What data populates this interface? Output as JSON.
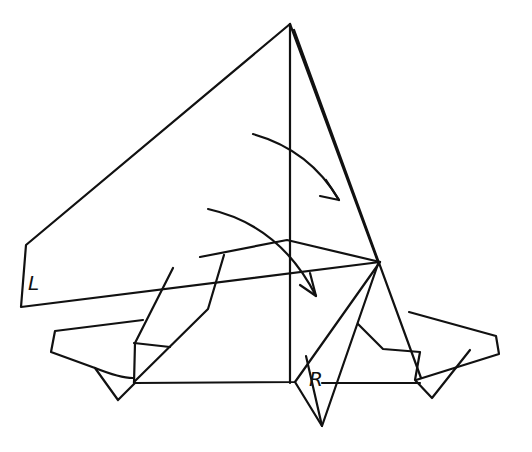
{
  "figure": {
    "type": "origami-fold-step",
    "labels": [
      {
        "id": "L",
        "text": "L",
        "x": 28,
        "y": 290
      },
      {
        "id": "R",
        "text": "R",
        "x": 313,
        "y": 387
      }
    ],
    "arrows": [
      {
        "id": "arrow-upper",
        "description": "curved fold arrow toward right flap",
        "from": [
          253,
          134
        ],
        "to": [
          339,
          200
        ]
      },
      {
        "id": "arrow-lower",
        "description": "curved fold arrow down-right",
        "from": [
          208,
          209
        ],
        "to": [
          316,
          296
        ]
      }
    ],
    "colors": {
      "ink": "#111111",
      "paper": "#ffffff"
    }
  }
}
